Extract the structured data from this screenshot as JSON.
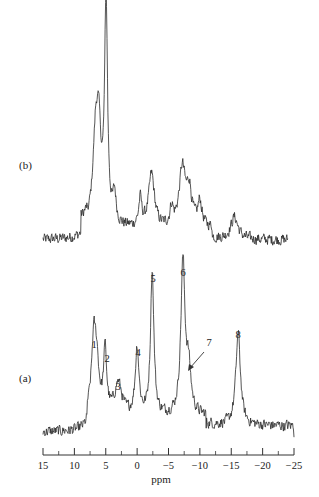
{
  "chart_data": {
    "type": "line",
    "title": "",
    "xlabel": "ppm",
    "ylabel": "",
    "xlim": [
      15,
      -25
    ],
    "x_reversed": true,
    "xticks_major": [
      15,
      10,
      5,
      0,
      -5,
      -10,
      -15,
      -20,
      -25
    ],
    "xticks_minor": [
      12.5,
      7.5,
      2.5,
      -2.5,
      -7.5,
      -12.5,
      -17.5,
      -22.5
    ],
    "grid": false,
    "legend": null,
    "series": [
      {
        "name": "(b)",
        "label": "(b)",
        "baseline_noise": true,
        "x_range": [
          15,
          -24
        ],
        "peaks": [
          {
            "ppm": 6.6,
            "height": 0.38,
            "width": 0.55
          },
          {
            "ppm": 6.1,
            "height": 0.32,
            "width": 0.45
          },
          {
            "ppm": 4.95,
            "height": 1.0,
            "width": 0.28
          },
          {
            "ppm": 3.6,
            "height": 0.13,
            "width": 0.3
          },
          {
            "ppm": -0.5,
            "height": 0.12,
            "width": 0.3
          },
          {
            "ppm": -2.3,
            "height": 0.24,
            "width": 0.55
          },
          {
            "ppm": -5.5,
            "height": 0.08,
            "width": 0.3
          },
          {
            "ppm": -7.2,
            "height": 0.26,
            "width": 0.6
          },
          {
            "ppm": -8.3,
            "height": 0.16,
            "width": 0.5
          },
          {
            "ppm": -10.0,
            "height": 0.11,
            "width": 0.4
          },
          {
            "ppm": -15.5,
            "height": 0.1,
            "width": 0.7
          }
        ]
      },
      {
        "name": "(a)",
        "label": "(a)",
        "baseline_noise": true,
        "x_range": [
          15,
          -25
        ],
        "peaks": [
          {
            "ppm": 6.9,
            "height": 0.5,
            "width": 0.45
          },
          {
            "ppm": 6.4,
            "height": 0.25,
            "width": 0.4
          },
          {
            "ppm": 5.1,
            "height": 0.41,
            "width": 0.3
          },
          {
            "ppm": 3.0,
            "height": 0.21,
            "width": 0.7
          },
          {
            "ppm": 0.0,
            "height": 0.44,
            "width": 0.35
          },
          {
            "ppm": -2.4,
            "height": 0.95,
            "width": 0.32
          },
          {
            "ppm": -7.3,
            "height": 1.0,
            "width": 0.4
          },
          {
            "ppm": -8.2,
            "height": 0.28,
            "width": 0.45
          },
          {
            "ppm": -16.1,
            "height": 0.6,
            "width": 0.45
          }
        ],
        "annotations": [
          {
            "text": "1",
            "ppm": 6.9
          },
          {
            "text": "2",
            "ppm": 5.1
          },
          {
            "text": "3",
            "ppm": 3.0
          },
          {
            "text": "4",
            "ppm": 0.0
          },
          {
            "text": "5",
            "ppm": -2.4
          },
          {
            "text": "6",
            "ppm": -7.3
          },
          {
            "text": "7",
            "ppm": -8.2,
            "arrow": true
          },
          {
            "text": "8",
            "ppm": -16.1
          }
        ]
      }
    ]
  },
  "labels": {
    "panel_b": "(b)",
    "panel_a": "(a)",
    "xlabel": "ppm",
    "ticks": [
      "15",
      "10",
      "5",
      "0",
      "−5",
      "−10",
      "−15",
      "−20",
      "−25"
    ],
    "peaks": [
      "1",
      "2",
      "3",
      "4",
      "5",
      "6",
      "7",
      "8"
    ]
  }
}
